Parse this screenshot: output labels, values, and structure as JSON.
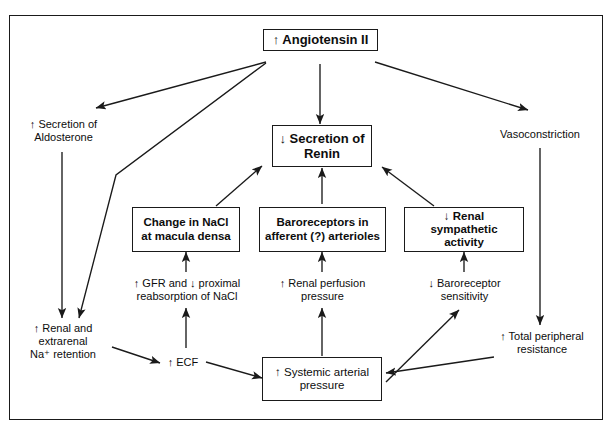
{
  "diagram": {
    "nodes": {
      "angiotensin": {
        "label": "↑ Angiotensin II"
      },
      "renin": {
        "label": "↓ Secretion of\nRenin",
        "line1": "↓ Secretion of",
        "line2": "Renin"
      },
      "aldosterone": {
        "line1": "↑ Secretion of",
        "line2": "Aldosterone"
      },
      "vasoconstriction": {
        "line1": "Vasoconstriction"
      },
      "macula_densa": {
        "line1": "Change in NaCl",
        "line2": "at macula densa"
      },
      "baroreceptors": {
        "line1": "Baroreceptors in",
        "line2": "afferent (?) arterioles"
      },
      "renal_sympathetic": {
        "line1": "↓ Renal sympathetic",
        "line2": "activity"
      },
      "gfr": {
        "line1": "↑ GFR and ↓ proximal",
        "line2": "reabsorption of NaCl"
      },
      "renal_perfusion": {
        "line1": "↑ Renal perfusion",
        "line2": "pressure"
      },
      "baroreceptor_sensitivity": {
        "line1": "↓ Baroreceptor",
        "line2": "sensitivity"
      },
      "na_retention": {
        "line1": "↑ Renal and",
        "line2": "extrarenal",
        "line3": "Na⁺ retention"
      },
      "ecf": {
        "line1": "↑ ECF"
      },
      "systemic_pressure": {
        "line1": "↑ Systemic arterial",
        "line2": "pressure"
      },
      "tpr": {
        "line1": "↑ Total peripheral",
        "line2": "resistance"
      }
    },
    "colors": {
      "stroke": "#1a1a1a",
      "text": "#0d0d0d",
      "background": "#ffffff"
    }
  }
}
